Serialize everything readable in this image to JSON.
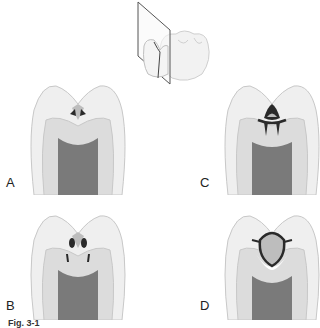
{
  "figure": {
    "caption": "Fig. 3-1",
    "colors": {
      "enamel": "#efefef",
      "enamel_stroke": "#c8c8c8",
      "dentin": "#dcdcdc",
      "pulp": "#7a7a7a",
      "pulp_light": "#9a9a9a",
      "lesion": "#2a2a2a",
      "cavity_fill": "#bdbdbd",
      "plane": "#555555"
    },
    "overview": {
      "description": "Molar with sectioning plane through occlusal fissure"
    },
    "panels": [
      {
        "id": "A",
        "label": "A",
        "stage": "initial fissure lesion"
      },
      {
        "id": "B",
        "label": "B",
        "stage": "lesion spreading laterally with dentin involvement"
      },
      {
        "id": "C",
        "label": "C",
        "stage": "lesion undermining enamel, spreading at DEJ"
      },
      {
        "id": "D",
        "label": "D",
        "stage": "cavitation with reparative dentin beneath"
      }
    ]
  }
}
